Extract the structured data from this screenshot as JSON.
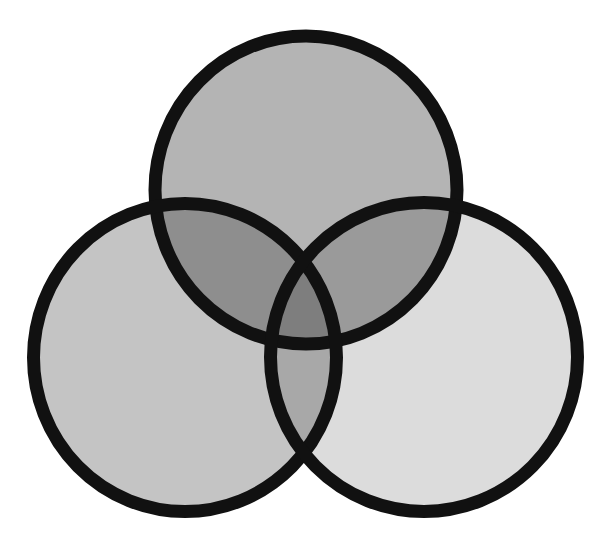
{
  "diagram": {
    "type": "venn",
    "set_count": 3,
    "sets": [
      {
        "id": "top",
        "label": ""
      },
      {
        "id": "left",
        "label": ""
      },
      {
        "id": "right",
        "label": ""
      }
    ],
    "regions": [
      {
        "sets": [
          "top"
        ],
        "label": ""
      },
      {
        "sets": [
          "left"
        ],
        "label": ""
      },
      {
        "sets": [
          "right"
        ],
        "label": ""
      },
      {
        "sets": [
          "top",
          "left"
        ],
        "label": ""
      },
      {
        "sets": [
          "top",
          "right"
        ],
        "label": ""
      },
      {
        "sets": [
          "left",
          "right"
        ],
        "label": ""
      },
      {
        "sets": [
          "top",
          "left",
          "right"
        ],
        "label": ""
      }
    ]
  },
  "colors": {
    "background": "#ffffff",
    "outline": "#111111",
    "top_only": "#b4b4b4",
    "left_only": "#c4c4c4",
    "right_only": "#dcdcdc",
    "top_left": "#8e8e8e",
    "top_right": "#9a9a9a",
    "left_right": "#a8a8a8",
    "all_three": "#7e7e7e"
  }
}
